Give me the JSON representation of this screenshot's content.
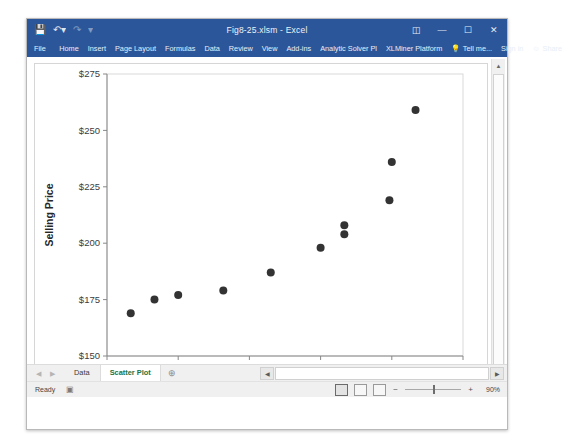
{
  "window": {
    "title": "Fig8-25.xlsm - Excel",
    "quick_access": [
      "save-icon",
      "undo-icon",
      "redo-icon",
      "customize-icon"
    ],
    "buttons": {
      "ribbon_display": "ribbon-display-icon",
      "minimize": "—",
      "maximize": "☐",
      "close": "✕"
    }
  },
  "ribbon": {
    "tabs": [
      {
        "label": "File"
      },
      {
        "label": "Home"
      },
      {
        "label": "Insert"
      },
      {
        "label": "Page Layout"
      },
      {
        "label": "Formulas"
      },
      {
        "label": "Data"
      },
      {
        "label": "Review"
      },
      {
        "label": "View"
      },
      {
        "label": "Add-ins"
      },
      {
        "label": "Analytic Solver Pl"
      },
      {
        "label": "XLMiner Platform"
      }
    ],
    "tell_me": "Tell me...",
    "sign_in": "Sign in",
    "share": "Share"
  },
  "sheet_tabs": {
    "items": [
      {
        "label": "Data",
        "active": false
      },
      {
        "label": "Scatter Plot",
        "active": true
      }
    ],
    "add_label": "⊕",
    "nav_first": "◀",
    "nav_last": "▶"
  },
  "status_bar": {
    "state": "Ready",
    "accessibility_icon": "accessibility-checker-icon",
    "view_normal": "normal-view-icon",
    "view_page_layout": "page-layout-view-icon",
    "view_page_break": "page-break-view-icon",
    "zoom_out": "−",
    "zoom_in": "+",
    "zoom_level": "90%"
  },
  "colors": {
    "title_bar": "#2b579a",
    "accent_green": "#217346",
    "marker": "#333333",
    "plot_border": "#d9d9d9",
    "axis_line": "#888888"
  },
  "chart_data": {
    "type": "scatter",
    "title": "",
    "xlabel": "Square Footage",
    "ylabel": "Selling Price",
    "xlim": [
      0.9,
      2.4
    ],
    "ylim": [
      150,
      275
    ],
    "xticks": [
      "0.900",
      "1.200",
      "1.500",
      "1.800",
      "2.100",
      "2.400"
    ],
    "xtick_values": [
      0.9,
      1.2,
      1.5,
      1.8,
      2.1,
      2.4
    ],
    "yticks": [
      "$150",
      "$175",
      "$200",
      "$225",
      "$250",
      "$275"
    ],
    "ytick_values": [
      150,
      175,
      200,
      225,
      250,
      275
    ],
    "grid": false,
    "legend": false,
    "marker_size": 4,
    "series": [
      {
        "name": "Selling Price vs Square Footage",
        "points": [
          {
            "x": 1.0,
            "y": 169
          },
          {
            "x": 1.1,
            "y": 175
          },
          {
            "x": 1.2,
            "y": 177
          },
          {
            "x": 1.39,
            "y": 179
          },
          {
            "x": 1.59,
            "y": 187
          },
          {
            "x": 1.8,
            "y": 198
          },
          {
            "x": 1.9,
            "y": 204
          },
          {
            "x": 1.9,
            "y": 208
          },
          {
            "x": 2.09,
            "y": 219
          },
          {
            "x": 2.1,
            "y": 236
          },
          {
            "x": 2.2,
            "y": 259
          }
        ]
      }
    ]
  }
}
